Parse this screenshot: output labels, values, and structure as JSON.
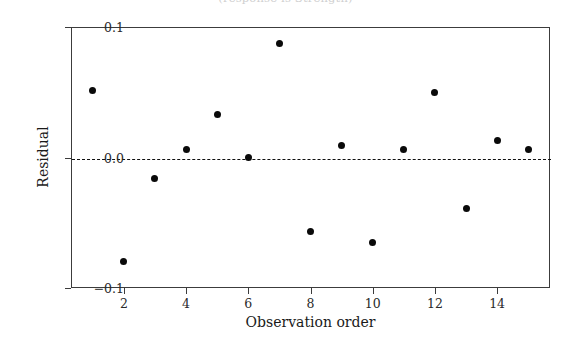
{
  "figure": {
    "cut_off_title": "(response is Strength)",
    "background_color": "#ffffff",
    "marker_color": "#0a0a0a",
    "axis_color": "#3c3c3c",
    "zero_line_color": "#111111"
  },
  "chart_data": {
    "type": "scatter",
    "title": "",
    "xlabel": "Observation order",
    "ylabel": "Residual",
    "x": [
      1,
      2,
      3,
      4,
      5,
      6,
      7,
      8,
      9,
      10,
      11,
      12,
      13,
      14,
      15
    ],
    "values": [
      0.051,
      -0.08,
      -0.016,
      0.006,
      0.033,
      0.0,
      0.087,
      -0.057,
      0.009,
      -0.065,
      0.006,
      0.05,
      -0.039,
      0.013,
      0.006
    ],
    "xlim": [
      0.3,
      15.7
    ],
    "ylim": [
      -0.1,
      0.1
    ],
    "xticks": [
      2,
      4,
      6,
      8,
      10,
      12,
      14
    ],
    "xticklabels": [
      "2",
      "4",
      "6",
      "8",
      "10",
      "12",
      "14"
    ],
    "yticks": [
      0.1,
      0.0,
      -0.1
    ],
    "yticklabels": [
      "0.1",
      "0.0",
      "−0.1"
    ],
    "grid": false,
    "legend": false,
    "reference_line": {
      "y": 0.0,
      "style": "dashed",
      "label": "zero residual line"
    },
    "marker": "filled-circle",
    "series_name": "Residuals versus the order of the data"
  }
}
